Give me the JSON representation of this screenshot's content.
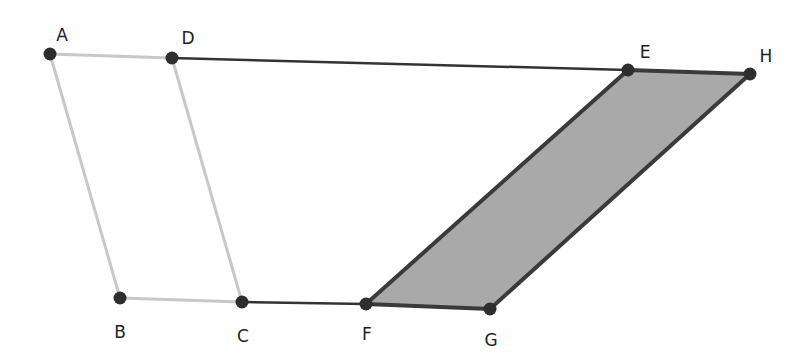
{
  "diagram": {
    "title": "",
    "colors": {
      "background": "#ffffff",
      "point": "#2e2e2e",
      "dark_segment": "#333333",
      "light_segment": "#c8c8c8",
      "shaded_fill": "#a9a9a9",
      "shaded_edge": "#3a3a3a",
      "label": "#222222"
    },
    "points": [
      {
        "name": "A",
        "x": 50,
        "y": 54,
        "label_x": 62,
        "label_y": 35
      },
      {
        "name": "D",
        "x": 172,
        "y": 58,
        "label_x": 188,
        "label_y": 38
      },
      {
        "name": "E",
        "x": 628,
        "y": 70,
        "label_x": 645,
        "label_y": 52
      },
      {
        "name": "H",
        "x": 750,
        "y": 74,
        "label_x": 766,
        "label_y": 56
      },
      {
        "name": "B",
        "x": 120,
        "y": 298,
        "label_x": 120,
        "label_y": 332
      },
      {
        "name": "C",
        "x": 242,
        "y": 302,
        "label_x": 243,
        "label_y": 336
      },
      {
        "name": "F",
        "x": 366,
        "y": 304,
        "label_x": 367,
        "label_y": 334
      },
      {
        "name": "G",
        "x": 490,
        "y": 309,
        "label_x": 491,
        "label_y": 340
      }
    ],
    "light_parallelogram": {
      "vertices": [
        "A",
        "D",
        "C",
        "B"
      ],
      "style": "light-outline"
    },
    "shaded_parallelogram": {
      "vertices": [
        "E",
        "H",
        "G",
        "F"
      ],
      "style": "filled-gray"
    },
    "dark_segments": [
      {
        "from": "D",
        "to": "E"
      },
      {
        "from": "C",
        "to": "F"
      }
    ],
    "labels": {
      "A": "A",
      "B": "B",
      "C": "C",
      "D": "D",
      "E": "E",
      "F": "F",
      "G": "G",
      "H": "H"
    }
  }
}
